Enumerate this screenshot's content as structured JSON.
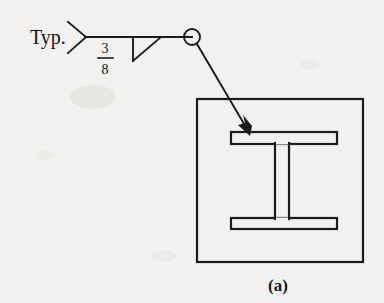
{
  "figure": {
    "caption": "(a)",
    "background_color": "#f2f1ef",
    "ink_color": "#1b1b1b"
  },
  "welding_symbol": {
    "tail_note": "Typ.",
    "weld_size": {
      "numerator": "3",
      "denominator": "8",
      "display": "3/8"
    },
    "weld_type_symbol": "fillet-weld-triangle",
    "all_around_symbol": "weld-all-around-circle",
    "leader_arrow": "solid-arrowhead",
    "reference_line": {
      "x_start": 85,
      "x_end": 192,
      "y": 37
    },
    "tail": {
      "apex_x": 85,
      "apex_y": 37,
      "upper_x": 68,
      "upper_y": 22,
      "lower_x": 68,
      "lower_y": 53
    },
    "triangle": {
      "vertical_x": 133,
      "top_y": 37,
      "bottom_y": 60,
      "hyp_end_x": 160
    },
    "circle": {
      "cx": 192,
      "cy": 37,
      "r": 8
    },
    "arrow": {
      "x_start": 197,
      "y_start": 44,
      "x_end": 250,
      "y_end": 134
    }
  },
  "detail_box": {
    "x": 197,
    "y": 99,
    "width": 166,
    "height": 163
  },
  "i_beam": {
    "name": "wide-flange-section",
    "flange_left_x": 231,
    "flange_right_x": 337,
    "top_flange_top_y": 132,
    "top_flange_bottom_y": 143,
    "bottom_flange_top_y": 218,
    "bottom_flange_bottom_y": 229,
    "web_left_x": 274,
    "web_right_x": 289
  },
  "labels": {
    "typ_x": 30,
    "typ_y": 44,
    "fraction_x": 105,
    "numerator_y": 53,
    "bar_y": 57,
    "denominator_y": 73,
    "caption_x": 278,
    "caption_y": 291
  }
}
